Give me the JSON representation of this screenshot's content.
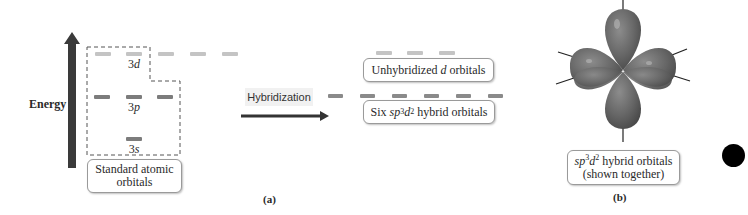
{
  "figure": {
    "panel_a": {
      "label": "(a)",
      "energy_axis": {
        "label": "Energy",
        "direction": "up"
      },
      "atomic_orbitals": {
        "box_label": "Standard atomic orbitals",
        "box_label_line1": "Standard atomic",
        "box_label_line2": "orbitals",
        "levels": [
          {
            "name": "3d",
            "prefix": "3",
            "letter": "d",
            "count": 5,
            "shade": "light"
          },
          {
            "name": "3p",
            "prefix": "3",
            "letter": "p",
            "count": 3,
            "shade": "dark"
          },
          {
            "name": "3s",
            "prefix": "3",
            "letter": "s",
            "count": 1,
            "shade": "dark"
          }
        ]
      },
      "process": {
        "label": "Hybridization"
      },
      "result": {
        "unhybridized": {
          "label": "Unhybridized d orbitals",
          "text_pre": "Unhybridized ",
          "text_italic": "d",
          "text_post": " orbitals",
          "count": 3
        },
        "hybrid": {
          "label": "Six sp3d2 hybrid orbitals",
          "text_pre": "Six ",
          "sp": "sp",
          "sup1": "3",
          "d": "d",
          "sup2": "2",
          "text_post": " hybrid orbitals",
          "count": 6
        }
      }
    },
    "panel_b": {
      "label": "(b)",
      "caption_line1_sp": "sp",
      "caption_line1_sup1": "3",
      "caption_line1_d": "d",
      "caption_line1_sup2": "2",
      "caption_line1_rest": " hybrid orbitals",
      "caption_line2": "(shown together)",
      "model": "sp3d2 hybrid orbitals (octahedral, six lobes)"
    },
    "colors": {
      "light_dash": "#c4c4c4",
      "dark_dash": "#7c7c7c",
      "arrow": "#3a3a3a",
      "orbital_lobe": "#6a6a6a",
      "dot": "#000000"
    }
  }
}
